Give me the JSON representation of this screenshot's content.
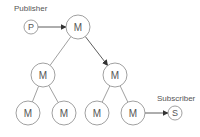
{
  "diagram": {
    "labels": {
      "publisher": "Publisher",
      "subscriber": "Subscriber"
    },
    "colors": {
      "stroke": "#888888",
      "text": "#555555",
      "arrow": "#333333",
      "background": "#ffffff"
    },
    "nodes": [
      {
        "id": "P",
        "label": "P",
        "role": "publisher",
        "cx": 31,
        "cy": 27,
        "r": 7
      },
      {
        "id": "M1",
        "label": "M",
        "role": "middleware",
        "cx": 78,
        "cy": 27,
        "r": 12
      },
      {
        "id": "M2",
        "label": "M",
        "role": "middleware",
        "cx": 43,
        "cy": 75,
        "r": 12
      },
      {
        "id": "M3",
        "label": "M",
        "role": "middleware",
        "cx": 115,
        "cy": 75,
        "r": 12
      },
      {
        "id": "M4",
        "label": "M",
        "role": "middleware",
        "cx": 28,
        "cy": 113,
        "r": 12
      },
      {
        "id": "M5",
        "label": "M",
        "role": "middleware",
        "cx": 64,
        "cy": 113,
        "r": 12
      },
      {
        "id": "M6",
        "label": "M",
        "role": "middleware",
        "cx": 97,
        "cy": 113,
        "r": 12
      },
      {
        "id": "M7",
        "label": "M",
        "role": "middleware",
        "cx": 133,
        "cy": 113,
        "r": 12
      },
      {
        "id": "S",
        "label": "S",
        "role": "subscriber",
        "cx": 175,
        "cy": 113,
        "r": 7
      }
    ],
    "edges": [
      {
        "from": "P",
        "to": "M1",
        "arrow": true
      },
      {
        "from": "M1",
        "to": "M2",
        "arrow": false
      },
      {
        "from": "M1",
        "to": "M3",
        "arrow": true
      },
      {
        "from": "M2",
        "to": "M4",
        "arrow": false
      },
      {
        "from": "M2",
        "to": "M5",
        "arrow": false
      },
      {
        "from": "M3",
        "to": "M6",
        "arrow": false
      },
      {
        "from": "M3",
        "to": "M7",
        "arrow": false
      },
      {
        "from": "M7",
        "to": "S",
        "arrow": true
      }
    ]
  }
}
